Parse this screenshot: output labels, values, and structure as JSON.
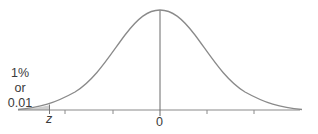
{
  "diagram": {
    "type": "normal-distribution",
    "curve_color": "#8a8a8a",
    "axis_color": "#8a8a8a",
    "shade_color": "#cfcfcf",
    "tail_label": {
      "line1": "1%",
      "line2": "or",
      "line3": "0.01"
    },
    "critical_value_label": "z",
    "mean_label": "0"
  }
}
